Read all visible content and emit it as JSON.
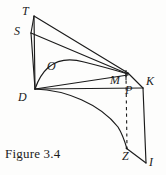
{
  "figure": {
    "caption": "Figure 3.4",
    "background_color": "#fdfdfc",
    "stroke_color": "#1b1b1b",
    "label_color": "#1b1b1b",
    "labels": [
      {
        "id": "T",
        "text": "T",
        "x": 22,
        "y": 6
      },
      {
        "id": "S",
        "text": "S",
        "x": 15,
        "y": 26
      },
      {
        "id": "O",
        "text": "O",
        "x": 48,
        "y": 61
      },
      {
        "id": "D",
        "text": "D",
        "x": 19,
        "y": 93
      },
      {
        "id": "M",
        "text": "M",
        "x": 111,
        "y": 76
      },
      {
        "id": "P",
        "text": "P",
        "x": 125,
        "y": 86
      },
      {
        "id": "K",
        "text": "K",
        "x": 146,
        "y": 77
      },
      {
        "id": "Z",
        "text": "Z",
        "x": 123,
        "y": 152
      },
      {
        "id": "I",
        "text": "I",
        "x": 149,
        "y": 157
      }
    ],
    "points": {
      "T": {
        "x": 34,
        "y": 16
      },
      "S": {
        "x": 31,
        "y": 33
      },
      "D": {
        "x": 35,
        "y": 89
      },
      "M": {
        "x": 126,
        "y": 74
      },
      "P": {
        "x": 126,
        "y": 84
      },
      "K": {
        "x": 143,
        "y": 88
      },
      "Z": {
        "x": 128,
        "y": 150
      },
      "I": {
        "x": 146,
        "y": 163
      },
      "O_apex": {
        "x": 70,
        "y": 60
      }
    },
    "segments": [
      {
        "name": "segment-T-D",
        "from": "T",
        "to": "D"
      },
      {
        "name": "segment-S-D",
        "from": "S",
        "to": "D"
      },
      {
        "name": "segment-T-M",
        "from": "T",
        "to": "M"
      },
      {
        "name": "segment-S-M",
        "from": "S",
        "to": "M"
      },
      {
        "name": "segment-D-M",
        "from": "D",
        "to": "M"
      },
      {
        "name": "segment-D-K",
        "from": "D",
        "to": "K"
      },
      {
        "name": "segment-M-K",
        "from": "M",
        "to": "K"
      },
      {
        "name": "segment-K-I",
        "from": "K",
        "to": "I"
      },
      {
        "name": "segment-Z-I",
        "from": "Z",
        "to": "I"
      }
    ],
    "curves": [
      {
        "name": "curve-D-O-M",
        "description": "arc from D rising through O down to M"
      },
      {
        "name": "curve-D-Z",
        "description": "concave arc from D sweeping down to Z"
      }
    ],
    "dashed_lines": [
      {
        "name": "dashed-M-P-Z",
        "from": "M",
        "to": "Z"
      }
    ]
  }
}
